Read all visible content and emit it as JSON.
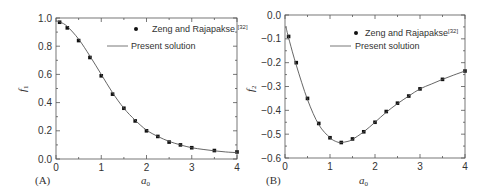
{
  "chart_data": [
    {
      "type": "line",
      "panel": "(A)",
      "title": "",
      "xlabel": "a0",
      "ylabel": "f1",
      "xlim": [
        0,
        4
      ],
      "ylim": [
        0.0,
        1.0
      ],
      "xticks": [
        "0",
        "1",
        "2",
        "3",
        "4"
      ],
      "yticks": [
        "0.0",
        "0.2",
        "0.4",
        "0.6",
        "0.8",
        "1.0"
      ],
      "grid": false,
      "legend_position": "upper right",
      "legend": [
        "Zeng and Rajapakse [32]",
        "Present solution"
      ],
      "series": [
        {
          "name": "Zeng and Rajapakse [32]",
          "style": "markers",
          "x": [
            0.08,
            0.25,
            0.5,
            0.75,
            1.0,
            1.25,
            1.5,
            1.75,
            2.0,
            2.25,
            2.5,
            2.75,
            3.0,
            3.5,
            4.0
          ],
          "y": [
            0.97,
            0.93,
            0.84,
            0.72,
            0.59,
            0.46,
            0.36,
            0.27,
            0.2,
            0.16,
            0.12,
            0.1,
            0.08,
            0.06,
            0.05
          ]
        },
        {
          "name": "Present solution",
          "style": "line",
          "x": [
            0.0,
            0.1,
            0.25,
            0.5,
            0.75,
            1.0,
            1.25,
            1.5,
            1.75,
            2.0,
            2.25,
            2.5,
            2.75,
            3.0,
            3.25,
            3.5,
            3.75,
            4.0
          ],
          "y": [
            0.98,
            0.97,
            0.94,
            0.85,
            0.73,
            0.6,
            0.47,
            0.36,
            0.275,
            0.205,
            0.16,
            0.125,
            0.1,
            0.08,
            0.068,
            0.058,
            0.05,
            0.045
          ]
        }
      ]
    },
    {
      "type": "line",
      "panel": "(B)",
      "title": "",
      "xlabel": "a0",
      "ylabel": "f2",
      "xlim": [
        0,
        4
      ],
      "ylim": [
        -0.6,
        0.0
      ],
      "xticks": [
        "0",
        "1",
        "2",
        "3",
        "4"
      ],
      "yticks": [
        "-0.6",
        "-0.5",
        "-0.4",
        "-0.3",
        "-0.2",
        "-0.1",
        "0.0"
      ],
      "grid": false,
      "legend_position": "upper right",
      "legend": [
        "Zeng and Rajapakse [32]",
        "Present solution"
      ],
      "series": [
        {
          "name": "Zeng and Rajapakse [32]",
          "style": "markers",
          "x": [
            0.08,
            0.25,
            0.5,
            0.75,
            1.0,
            1.25,
            1.5,
            1.75,
            2.0,
            2.25,
            2.5,
            2.75,
            3.0,
            3.5,
            4.0
          ],
          "y": [
            -0.09,
            -0.2,
            -0.35,
            -0.455,
            -0.515,
            -0.535,
            -0.52,
            -0.49,
            -0.45,
            -0.405,
            -0.37,
            -0.34,
            -0.31,
            -0.27,
            -0.235
          ]
        },
        {
          "name": "Present solution",
          "style": "line",
          "x": [
            0.02,
            0.1,
            0.25,
            0.5,
            0.75,
            1.0,
            1.15,
            1.25,
            1.4,
            1.5,
            1.75,
            2.0,
            2.25,
            2.5,
            2.75,
            3.0,
            3.25,
            3.5,
            3.75,
            4.0
          ],
          "y": [
            -0.05,
            -0.11,
            -0.21,
            -0.355,
            -0.46,
            -0.515,
            -0.532,
            -0.535,
            -0.53,
            -0.522,
            -0.49,
            -0.45,
            -0.408,
            -0.372,
            -0.34,
            -0.31,
            -0.29,
            -0.27,
            -0.252,
            -0.235
          ]
        }
      ]
    }
  ],
  "panels": [
    {
      "label": "(A)",
      "xlabel": "a",
      "xlabel_sub": "0",
      "ylabel": "f",
      "ylabel_sub": "1",
      "legend_marker_text": "Zeng and Rajapakse",
      "legend_ref": "[32]",
      "legend_line_text": "Present solution"
    },
    {
      "label": "(B)",
      "xlabel": "a",
      "xlabel_sub": "0",
      "ylabel": "f",
      "ylabel_sub": "2",
      "legend_marker_text": "Zeng and Rajapakse",
      "legend_ref": "[32]",
      "legend_line_text": "Present solution"
    }
  ],
  "colors": {
    "axis": "#555555",
    "line": "#555555",
    "marker": "#111111",
    "text": "#333333"
  }
}
